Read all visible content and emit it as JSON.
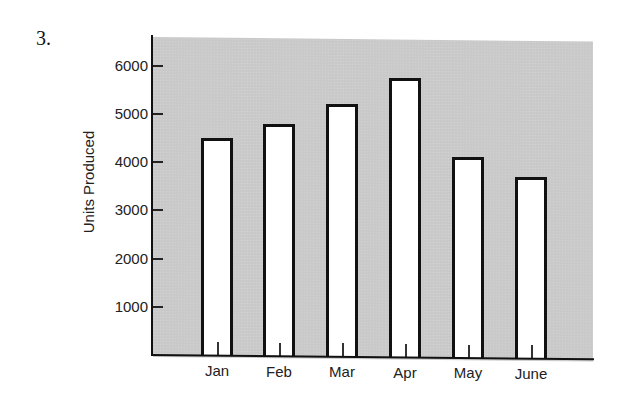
{
  "problem_number": "3.",
  "chart_data": {
    "type": "bar",
    "title": "",
    "xlabel": "",
    "ylabel": "Units Produced",
    "categories": [
      "Jan",
      "Feb",
      "Mar",
      "Apr",
      "May",
      "June"
    ],
    "values": [
      4500,
      4800,
      5200,
      5750,
      4100,
      3700
    ],
    "yticks": [
      1000,
      2000,
      3000,
      4000,
      5000,
      6000
    ],
    "ytick_labels": [
      "1000",
      "2000",
      "3000",
      "4000",
      "5000",
      "6000"
    ],
    "ylim": [
      0,
      6600
    ],
    "grid": false,
    "legend": null,
    "colors": {
      "plot_background": "#c9c9c9",
      "bar_fill": "#ffffff",
      "bar_edge": "#111111"
    }
  }
}
